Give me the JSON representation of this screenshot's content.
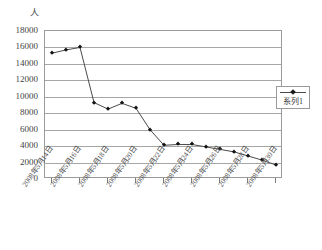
{
  "chart_data": {
    "type": "line",
    "title": "",
    "subtitle": "",
    "xlabel": "",
    "ylabel": "人",
    "ylim": [
      0,
      18000
    ],
    "ytick_step": 2000,
    "yticks": [
      18000,
      16000,
      14000,
      12000,
      10000,
      8000,
      6000,
      4000,
      2000,
      0
    ],
    "ytick_labels": [
      "18000",
      "16000",
      "14000",
      "12000",
      "10000",
      "8000",
      "6000",
      "4000",
      "2000",
      "0"
    ],
    "grid": true,
    "grid_axis": "y",
    "legend": {
      "position": "right",
      "entries": [
        "系列1"
      ]
    },
    "marker": "diamond",
    "line_color": "#4a4a4a",
    "marker_color": "#141414",
    "categories": [
      "2008年5月14日",
      "2008年5月15日",
      "2008年5月16日",
      "2008年5月17日",
      "2008年5月18日",
      "2008年5月19日",
      "2008年5月20日",
      "2008年5月21日",
      "2008年5月22日",
      "2008年5月23日",
      "2008年5月24日",
      "2008年5月25日",
      "2008年5月26日",
      "2008年5月27日",
      "2008年5月28日",
      "2008年5月29日",
      "2008年5月30日"
    ],
    "xtick_labels": [
      "2008年5月14日",
      "2008年5月16日",
      "2008年5月18日",
      "2008年5月20日",
      "2008年5月22日",
      "2008年5月24日",
      "2008年5月26日",
      "2008年5月28日",
      "2008年5月30日"
    ],
    "xtick_indices": [
      0,
      2,
      4,
      6,
      8,
      10,
      12,
      14,
      16
    ],
    "series": [
      {
        "name": "系列1",
        "values": [
          15300,
          15700,
          16000,
          9300,
          8500,
          9200,
          8600,
          6000,
          4100,
          4200,
          4200,
          3900,
          3600,
          3300,
          2800,
          2300,
          1700
        ]
      }
    ]
  }
}
